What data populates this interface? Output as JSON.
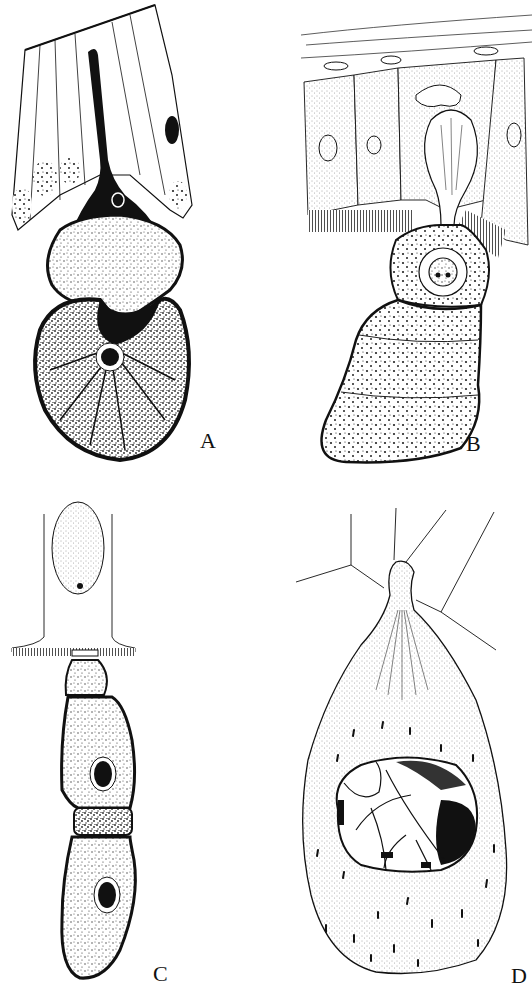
{
  "figure": {
    "panels": [
      {
        "id": "A",
        "label": "A",
        "description": "Elongated dark attachment stalk penetrating columnar epithelium, with bilobed stippled body and nucleus"
      },
      {
        "id": "B",
        "label": "B",
        "description": "Club-shaped epimerite inserted between epithelial cells with brush border; segmented stippled body with nucleus"
      },
      {
        "id": "C",
        "label": "C",
        "description": "Chain of two stippled cells with dark nuclei attached below a single epithelial cell"
      },
      {
        "id": "D",
        "label": "D",
        "description": "Pear-shaped stippled cyst attached by narrow neck between cells, containing a polygonal inclusion"
      }
    ]
  },
  "colors": {
    "ink": "#111111",
    "paper": "#ffffff",
    "stipple": "#333333"
  }
}
